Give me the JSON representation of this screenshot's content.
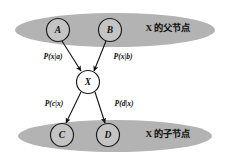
{
  "diagram": {
    "background_color": "#ffffff",
    "group_fill_color": "#b3b3b3",
    "node_fill_color": "#ffffff",
    "stroke_color": "#111111",
    "groups": [
      {
        "id": "parents",
        "label": "X 的父节点",
        "label_x": 168,
        "label_y": 29,
        "cx": 115,
        "cy": 30,
        "rx": 100,
        "ry": 17
      },
      {
        "id": "children",
        "label": "X 的子节点",
        "label_x": 168,
        "label_y": 135,
        "cx": 115,
        "cy": 136,
        "rx": 97,
        "ry": 16
      }
    ],
    "nodes": [
      {
        "id": "A",
        "label": "A",
        "cx": 58,
        "cy": 30,
        "r": 11.5,
        "shaded": true
      },
      {
        "id": "B",
        "label": "B",
        "cx": 110,
        "cy": 30,
        "r": 11.5,
        "shaded": true
      },
      {
        "id": "X",
        "label": "X",
        "cx": 88,
        "cy": 82,
        "r": 11.5,
        "shaded": false
      },
      {
        "id": "C",
        "label": "C",
        "cx": 62,
        "cy": 135,
        "r": 11.5,
        "shaded": true
      },
      {
        "id": "D",
        "label": "D",
        "cx": 108,
        "cy": 135,
        "r": 11.5,
        "shaded": true
      }
    ],
    "edges": [
      {
        "id": "a-to-x",
        "from": "A",
        "to": "X",
        "label": "P(x|a)",
        "label_x": 53,
        "label_y": 57,
        "x1": 62,
        "y1": 41,
        "x2": 81,
        "y2": 71
      },
      {
        "id": "b-to-x",
        "from": "B",
        "to": "X",
        "label": "P(x|b)",
        "label_x": 123,
        "label_y": 57,
        "x1": 106,
        "y1": 41,
        "x2": 94,
        "y2": 71
      },
      {
        "id": "x-to-c",
        "from": "X",
        "to": "C",
        "label": "P(c|x)",
        "label_x": 54,
        "label_y": 104,
        "x1": 81,
        "y1": 92,
        "x2": 66,
        "y2": 123
      },
      {
        "id": "x-to-d",
        "from": "X",
        "to": "D",
        "label": "P(d|x)",
        "label_x": 124,
        "label_y": 104,
        "x1": 95,
        "y1": 92,
        "x2": 105,
        "y2": 123
      }
    ]
  }
}
